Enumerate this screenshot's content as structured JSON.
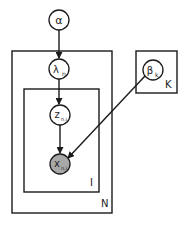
{
  "diagram": {
    "type": "plate-notation",
    "nodes": [
      {
        "id": "alpha",
        "label": "α",
        "sub": "",
        "observed": false
      },
      {
        "id": "lambda",
        "label": "λ",
        "sub": "n",
        "observed": false
      },
      {
        "id": "z",
        "label": "z",
        "sub": "n,i",
        "observed": false
      },
      {
        "id": "x",
        "label": "x",
        "sub": "n,i",
        "observed": true
      },
      {
        "id": "beta",
        "label": "β",
        "sub": "k",
        "observed": false
      }
    ],
    "edges": [
      {
        "from": "alpha",
        "to": "lambda"
      },
      {
        "from": "lambda",
        "to": "z"
      },
      {
        "from": "z",
        "to": "x"
      },
      {
        "from": "beta",
        "to": "x"
      }
    ],
    "plates": [
      {
        "id": "N",
        "label": "N"
      },
      {
        "id": "I",
        "label": "I"
      },
      {
        "id": "K",
        "label": "K"
      }
    ],
    "colors": {
      "stroke": "#1a1a1a",
      "observed_fill": "#a8a8a8",
      "latent_fill": "#ffffff"
    }
  }
}
